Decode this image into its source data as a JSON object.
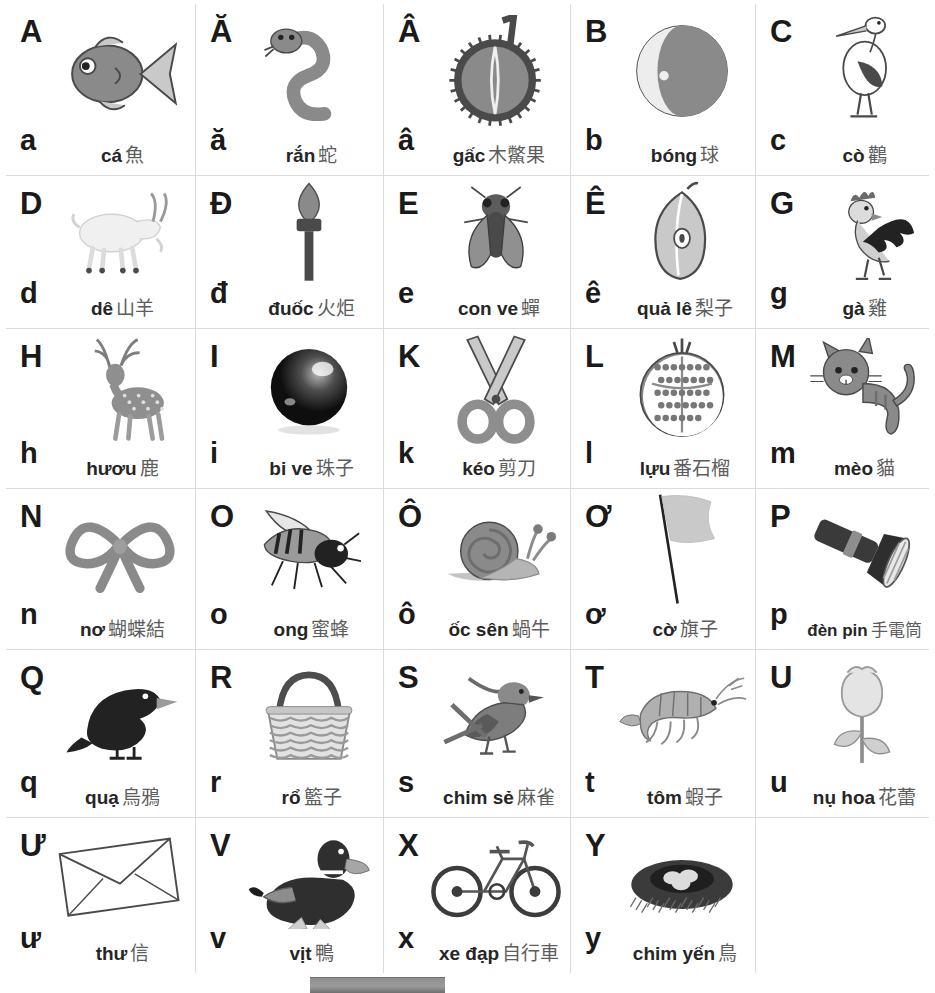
{
  "chart": {
    "colors": {
      "background": "#ffffff",
      "grid_line": "#dcdcdc",
      "letter": "#1a1a1a",
      "vietnamese_word": "#262626",
      "han_gloss": "#5d5d5d",
      "bottom_bar": "#8e8e8e"
    },
    "rows": [
      [
        {
          "upper": "A",
          "lower": "a",
          "viet": "cá",
          "han": "魚",
          "art": "fish"
        },
        {
          "upper": "Ă",
          "lower": "ă",
          "viet": "rắn",
          "han": "蛇",
          "art": "snake"
        },
        {
          "upper": "Â",
          "lower": "â",
          "viet": "gấc",
          "han": "木鱉果",
          "art": "gac-fruit"
        },
        {
          "upper": "B",
          "lower": "b",
          "viet": "bóng",
          "han": "球",
          "art": "beach-ball"
        },
        {
          "upper": "C",
          "lower": "c",
          "viet": "cò",
          "han": "鸛",
          "art": "stork"
        }
      ],
      [
        {
          "upper": "D",
          "lower": "d",
          "viet": "dê",
          "han": "山羊",
          "art": "goat"
        },
        {
          "upper": "Đ",
          "lower": "đ",
          "viet": "đuốc",
          "han": "火炬",
          "art": "torch"
        },
        {
          "upper": "E",
          "lower": "e",
          "viet": "con ve",
          "han": "蟬",
          "art": "cicada"
        },
        {
          "upper": "Ê",
          "lower": "ê",
          "viet": "quả lê",
          "han": "梨子",
          "art": "pear"
        },
        {
          "upper": "G",
          "lower": "g",
          "viet": "gà",
          "han": "雞",
          "art": "rooster"
        }
      ],
      [
        {
          "upper": "H",
          "lower": "h",
          "viet": "hươu",
          "han": "鹿",
          "art": "deer"
        },
        {
          "upper": "I",
          "lower": "i",
          "viet": "bi ve",
          "han": "珠子",
          "art": "marble"
        },
        {
          "upper": "K",
          "lower": "k",
          "viet": "kéo",
          "han": "剪刀",
          "art": "scissors"
        },
        {
          "upper": "L",
          "lower": "l",
          "viet": "lựu",
          "han": "番石榴",
          "art": "pomegranate"
        },
        {
          "upper": "M",
          "lower": "m",
          "viet": "mèo",
          "han": "貓",
          "art": "cat"
        }
      ],
      [
        {
          "upper": "N",
          "lower": "n",
          "viet": "nơ",
          "han": "蝴蝶結",
          "art": "ribbon-bow"
        },
        {
          "upper": "O",
          "lower": "o",
          "viet": "ong",
          "han": "蜜蜂",
          "art": "bee"
        },
        {
          "upper": "Ô",
          "lower": "ô",
          "viet": "ốc sên",
          "han": "蝸牛",
          "art": "snail"
        },
        {
          "upper": "Ơ",
          "lower": "ơ",
          "viet": "cờ",
          "han": "旗子",
          "art": "flag"
        },
        {
          "upper": "P",
          "lower": "p",
          "viet": "đèn pin",
          "han": "手電筒",
          "art": "flashlight"
        }
      ],
      [
        {
          "upper": "Q",
          "lower": "q",
          "viet": "quạ",
          "han": "烏鴉",
          "art": "crow"
        },
        {
          "upper": "R",
          "lower": "r",
          "viet": "rổ",
          "han": "籃子",
          "art": "basket"
        },
        {
          "upper": "S",
          "lower": "s",
          "viet": "chim sẻ",
          "han": "麻雀",
          "art": "sparrow"
        },
        {
          "upper": "T",
          "lower": "t",
          "viet": "tôm",
          "han": "蝦子",
          "art": "shrimp"
        },
        {
          "upper": "U",
          "lower": "u",
          "viet": "nụ hoa",
          "han": "花蕾",
          "art": "flower-bud"
        }
      ],
      [
        {
          "upper": "Ư",
          "lower": "ư",
          "viet": "thư",
          "han": "信",
          "art": "envelope"
        },
        {
          "upper": "V",
          "lower": "v",
          "viet": "vịt",
          "han": "鴨",
          "art": "duck"
        },
        {
          "upper": "X",
          "lower": "x",
          "viet": "xe đạp",
          "han": "自行車",
          "art": "bicycle"
        },
        {
          "upper": "Y",
          "lower": "y",
          "viet": "chim yến",
          "han": "鳥",
          "art": "bird-nest"
        },
        {
          "upper": "",
          "lower": "",
          "viet": "",
          "han": "",
          "art": ""
        }
      ]
    ]
  }
}
